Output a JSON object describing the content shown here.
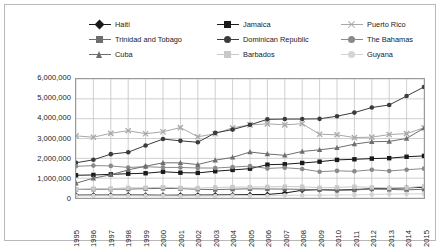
{
  "chart_data": {
    "type": "line",
    "title": "",
    "xlabel": "",
    "ylabel": "",
    "grid": true,
    "legend_position": "top",
    "ylim": [
      0,
      6000000
    ],
    "ytick_labels": [
      "6,000,000",
      "5,000,000",
      "4,000,000",
      "3,000,000",
      "2,000,000",
      "1,000,000",
      "0"
    ],
    "ytick_values": [
      6000000,
      5000000,
      4000000,
      3000000,
      2000000,
      1000000,
      0
    ],
    "categories": [
      "1995",
      "1996",
      "1997",
      "1998",
      "1999",
      "2000",
      "2001",
      "2002",
      "2003",
      "2004",
      "2005",
      "2006",
      "2007",
      "2008",
      "2009",
      "2010",
      "2011",
      "2012",
      "2013",
      "2014",
      "2015"
    ],
    "series": [
      {
        "name": "Haiti",
        "marker": "diamond",
        "color": "#1a1a1a",
        "values": [
          145000,
          150000,
          148000,
          152000,
          150000,
          140000,
          145000,
          150000,
          155000,
          160000,
          170000,
          180000,
          250000,
          390000,
          420000,
          400000,
          430000,
          465000,
          480000,
          510000,
          540000
        ]
      },
      {
        "name": "Jamaica",
        "marker": "square",
        "color": "#1a1a1a",
        "values": [
          1147000,
          1162000,
          1192000,
          1225000,
          1248000,
          1323000,
          1277000,
          1266000,
          1350000,
          1415000,
          1479000,
          1679000,
          1701000,
          1767000,
          1831000,
          1922000,
          1952000,
          1986000,
          2008000,
          2080000,
          2123000
        ]
      },
      {
        "name": "Puerto Rico",
        "marker": "x",
        "color": "#a8a8a8",
        "values": [
          3131000,
          3065000,
          3260000,
          3394000,
          3240000,
          3341000,
          3551000,
          3087000,
          3239000,
          3541000,
          3686000,
          3740000,
          3687000,
          3746000,
          3215000,
          3186000,
          3046000,
          3068000,
          3200000,
          3245000,
          3542000
        ]
      },
      {
        "name": "Trinidad and Tobago",
        "marker": "square",
        "color": "#6e6e6e",
        "values": [
          431000,
          441000,
          446000,
          449000,
          471000,
          487000,
          473000,
          441000,
          424000,
          446000,
          463000,
          456000,
          449000,
          437000,
          420000,
          388000,
          403000,
          457000,
          434000,
          412000,
          440000
        ]
      },
      {
        "name": "Dominican Republic",
        "marker": "circle",
        "color": "#3c3c3c",
        "values": [
          1776000,
          1926000,
          2211000,
          2309000,
          2649000,
          2972000,
          2882000,
          2811000,
          3282000,
          3450000,
          3691000,
          3965000,
          3980000,
          3980000,
          3992000,
          4125000,
          4306000,
          4563000,
          4690000,
          5141000,
          5600000
        ]
      },
      {
        "name": "The Bahamas",
        "marker": "circle",
        "color": "#8a8a8a",
        "values": [
          1598000,
          1633000,
          1618000,
          1540000,
          1577000,
          1544000,
          1538000,
          1513000,
          1510000,
          1561000,
          1608000,
          1491000,
          1528000,
          1463000,
          1327000,
          1370000,
          1346000,
          1422000,
          1363000,
          1428000,
          1480000
        ]
      },
      {
        "name": "Cuba",
        "marker": "triangle",
        "color": "#6e6e6e",
        "values": [
          745000,
          999000,
          1170000,
          1416000,
          1603000,
          1774000,
          1774000,
          1686000,
          1905000,
          2048000,
          2319000,
          2221000,
          2152000,
          2348000,
          2430000,
          2532000,
          2716000,
          2838000,
          2852000,
          3002000,
          3525000
        ]
      },
      {
        "name": "Barbados",
        "marker": "square",
        "color": "#c9c9c9",
        "values": [
          442000,
          472000,
          472000,
          512000,
          515000,
          545000,
          507000,
          498000,
          531000,
          552000,
          548000,
          562000,
          573000,
          568000,
          519000,
          532000,
          568000,
          536000,
          508000,
          520000,
          592000
        ]
      },
      {
        "name": "Guyana",
        "marker": "circle",
        "color": "#d4d4d4",
        "values": [
          106000,
          112000,
          112000,
          111000,
          107000,
          105000,
          99000,
          104000,
          101000,
          122000,
          117000,
          113000,
          134000,
          141000,
          141000,
          152000,
          157000,
          177000,
          199000,
          206000,
          207000
        ]
      }
    ]
  },
  "legend": {
    "rows": [
      [
        {
          "label": "Haiti",
          "marker": "diamond",
          "color": "#1a1a1a"
        },
        {
          "label": "Jamaica",
          "marker": "square",
          "color": "#1a1a1a"
        },
        {
          "label": "Puerto Rico",
          "marker": "x",
          "color": "#a8a8a8"
        }
      ],
      [
        {
          "label": "Trinidad and Tobago",
          "marker": "square",
          "color": "#6e6e6e"
        },
        {
          "label": "Dominican Republic",
          "marker": "circle",
          "color": "#3c3c3c"
        },
        {
          "label": "The Bahamas",
          "marker": "circle",
          "color": "#8a8a8a"
        }
      ],
      [
        {
          "label": "Cuba",
          "marker": "triangle",
          "color": "#6e6e6e"
        },
        {
          "label": "Barbados",
          "marker": "square",
          "color": "#c9c9c9"
        },
        {
          "label": "Guyana",
          "marker": "circle",
          "color": "#d4d4d4"
        }
      ]
    ]
  },
  "colors": {
    "plot_border": "#9a9a9a",
    "gridline": "#c4c4c4",
    "outer_border": "#b9b9b9",
    "text": "#1a1a1a",
    "background": "#ffffff"
  }
}
